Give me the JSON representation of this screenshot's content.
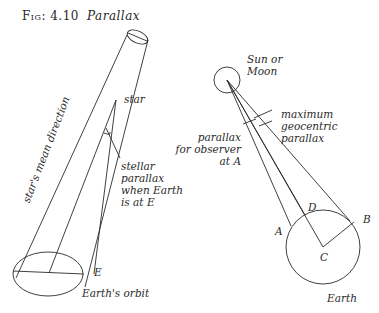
{
  "figure": {
    "number": "Fig: 4.10",
    "title": "Parallax"
  },
  "left_diagram": {
    "labels": {
      "star": "star",
      "stellar_parallax": "stellar\nparallax\nwhen Earth\nis at E",
      "mean_direction": "star's mean direction",
      "point_e": "E",
      "orbit": "Earth's orbit"
    }
  },
  "right_diagram": {
    "labels": {
      "body": "Sun or\nMoon",
      "max_parallax": "maximum\ngeocentric\nparallax",
      "observer_parallax": "parallax\nfor observer\nat A",
      "point_a": "A",
      "point_b": "B",
      "point_c": "C",
      "point_d": "D",
      "earth": "Earth"
    }
  }
}
